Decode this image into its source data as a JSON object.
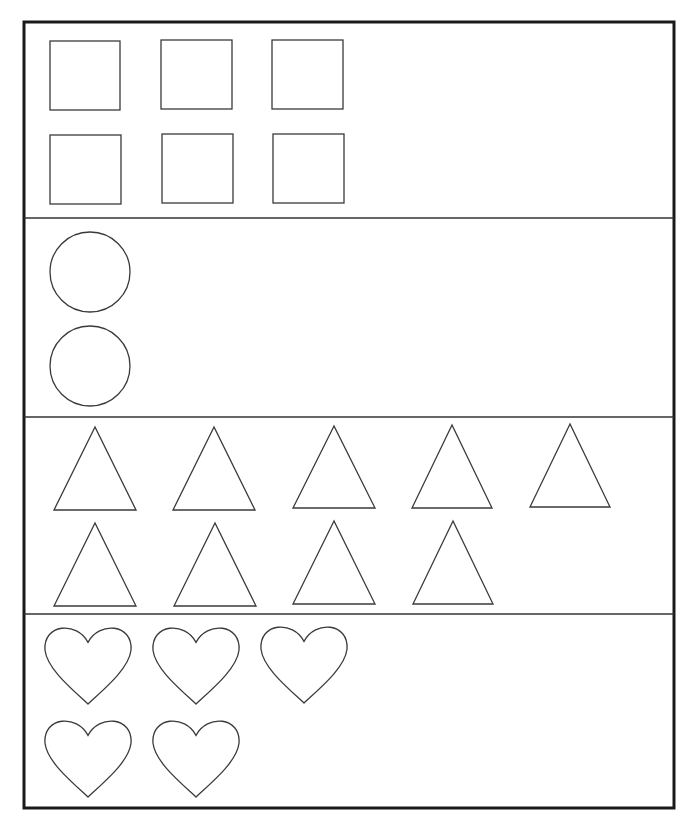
{
  "worksheet": {
    "colors": {
      "line": "#3a3a3a",
      "border": "#1a1a1a",
      "background": "#ffffff"
    },
    "sections": [
      {
        "shape": "square",
        "count": 6,
        "items": [
          {
            "x": 50,
            "y": 41,
            "w": 70,
            "h": 69
          },
          {
            "x": 161,
            "y": 40,
            "w": 71,
            "h": 69
          },
          {
            "x": 272,
            "y": 40,
            "w": 71,
            "h": 69
          },
          {
            "x": 50,
            "y": 135,
            "w": 71,
            "h": 69
          },
          {
            "x": 162,
            "y": 134,
            "w": 71,
            "h": 69
          },
          {
            "x": 273,
            "y": 134,
            "w": 71,
            "h": 69
          }
        ]
      },
      {
        "shape": "circle",
        "count": 2,
        "items": [
          {
            "cx": 90,
            "cy": 272,
            "r": 40
          },
          {
            "cx": 90,
            "cy": 366,
            "r": 40
          }
        ]
      },
      {
        "shape": "triangle",
        "count": 9,
        "items": [
          {
            "cx": 95,
            "top": 427,
            "base": 510,
            "half": 41
          },
          {
            "cx": 214,
            "top": 427,
            "base": 510,
            "half": 41
          },
          {
            "cx": 334,
            "top": 426,
            "base": 508,
            "half": 41
          },
          {
            "cx": 452,
            "top": 425,
            "base": 508,
            "half": 40
          },
          {
            "cx": 570,
            "top": 424,
            "base": 507,
            "half": 40
          },
          {
            "cx": 95,
            "top": 523,
            "base": 606,
            "half": 41
          },
          {
            "cx": 215,
            "top": 523,
            "base": 606,
            "half": 41
          },
          {
            "cx": 334,
            "top": 521,
            "base": 604,
            "half": 41
          },
          {
            "cx": 453,
            "top": 521,
            "base": 604,
            "half": 40
          }
        ]
      },
      {
        "shape": "heart",
        "count": 5,
        "items": [
          {
            "cx": 88,
            "top": 625,
            "w": 86,
            "h": 79
          },
          {
            "cx": 196,
            "top": 625,
            "w": 86,
            "h": 79
          },
          {
            "cx": 304,
            "top": 624,
            "w": 86,
            "h": 79
          },
          {
            "cx": 88,
            "top": 718,
            "w": 86,
            "h": 79
          },
          {
            "cx": 196,
            "top": 718,
            "w": 86,
            "h": 79
          }
        ]
      }
    ],
    "frame": {
      "x": 24,
      "y": 22,
      "w": 650,
      "h": 786
    },
    "dividers_y": [
      218,
      417,
      614
    ]
  }
}
